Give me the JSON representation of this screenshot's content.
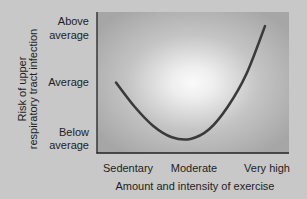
{
  "chart_data": {
    "type": "line",
    "title": "",
    "xlabel": "Amount and intensity of exercise",
    "ylabel_lines": [
      "Risk of upper",
      "respiratory tract infection"
    ],
    "ylabel": "Risk of upper respiratory tract infection",
    "x_categories": [
      "Sedentary",
      "Moderate",
      "Very high"
    ],
    "y_categories": [
      {
        "lines": [
          "Above",
          "average"
        ],
        "level": 2
      },
      {
        "lines": [
          "Average"
        ],
        "level": 1
      },
      {
        "lines": [
          "Below",
          "average"
        ],
        "level": 0
      }
    ],
    "xlim": [
      0,
      2
    ],
    "ylim": [
      -0.2,
      2.3
    ],
    "grid": false,
    "legend": "none",
    "series": [
      {
        "name": "Risk curve (J-shaped)",
        "color": "#3a3a3a",
        "points": [
          {
            "x": 0.0,
            "y": 1.05
          },
          {
            "x": 0.25,
            "y": 0.62
          },
          {
            "x": 0.5,
            "y": 0.28
          },
          {
            "x": 0.75,
            "y": 0.08
          },
          {
            "x": 1.0,
            "y": 0.05
          },
          {
            "x": 1.25,
            "y": 0.22
          },
          {
            "x": 1.5,
            "y": 0.62
          },
          {
            "x": 1.75,
            "y": 1.2
          },
          {
            "x": 2.0,
            "y": 2.05
          }
        ]
      }
    ],
    "colors": {
      "page_background": "#c8c8c8",
      "plot_background_edge": "#a6a6a6",
      "plot_background_center": "#f7f7f7",
      "axis": "#222222",
      "text": "#1e1e1e"
    }
  }
}
